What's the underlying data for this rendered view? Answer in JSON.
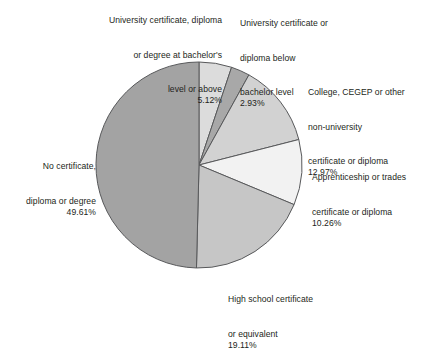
{
  "chart_data": {
    "type": "pie",
    "title": "",
    "subtitle": "",
    "xlabel": "",
    "ylabel": "",
    "legend_position": "none",
    "grid": false,
    "units": "percent",
    "start_angle_deg": 0,
    "direction": "clockwise",
    "categories": [
      "University certificate, diploma or degree at bachelor's level or above",
      "University certificate or diploma below bachelor level",
      "College, CEGEP or other non-university certificate or diploma",
      "Apprenticeship or trades certificate or diploma",
      "High school certificate or equivalent",
      "No certificate, diploma or degree"
    ],
    "values": [
      5.12,
      2.93,
      12.97,
      10.26,
      19.11,
      49.61
    ],
    "value_labels": [
      "5.12%",
      "2.93%",
      "12.97%",
      "10.26%",
      "19.11%",
      "49.61%"
    ],
    "colors": [
      "#dcdcdc",
      "#a8a8a8",
      "#d2d2d2",
      "#f2f2f2",
      "#c6c6c6",
      "#a3a3a3"
    ],
    "stroke_color": "#58595b"
  },
  "labels": {
    "bachelor": {
      "line1": "University certificate, diploma",
      "line2": "or degree at bachelor's",
      "line3": "level or above",
      "value": "5.12%"
    },
    "below_bachelor": {
      "line1": "University certificate or",
      "line2": "diploma below",
      "line3": "bachelor level",
      "value": "2.93%"
    },
    "college": {
      "line1": "College, CEGEP or other",
      "line2": "non-university",
      "line3": "certificate or diploma",
      "value": "12.97%"
    },
    "apprentice": {
      "line1": "Apprenticeship or trades",
      "line2": "certificate or diploma",
      "value": "10.26%"
    },
    "highschool": {
      "line1": "High school certificate",
      "line2": "or equivalent",
      "value": "19.11%"
    },
    "nocert": {
      "line1": "No certificate,",
      "line2": "diploma or degree",
      "value": "49.61%"
    }
  }
}
